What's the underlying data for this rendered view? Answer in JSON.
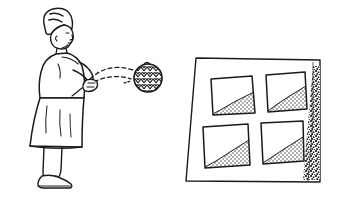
{
  "image": {
    "title": "Woman tossing a textured ball toward a perforated target board",
    "style": "black-and-white line drawing",
    "background_color": "#ffffff",
    "ink_color": "#1a1a1a",
    "width": 339,
    "height": 199
  },
  "figure": {
    "name": "woman-figure",
    "description": "Woman standing in profile facing right, arms extended forward after releasing a ball",
    "parts": [
      {
        "name": "head",
        "label": "head with short wavy hair"
      },
      {
        "name": "hair",
        "label": "short wavy hair"
      },
      {
        "name": "face",
        "label": "face in right profile"
      },
      {
        "name": "torso",
        "label": "torso in long dress"
      },
      {
        "name": "arm",
        "label": "extended arm"
      },
      {
        "name": "hands",
        "label": "open hands released forward"
      },
      {
        "name": "skirt",
        "label": "long skirt to calf"
      },
      {
        "name": "legs",
        "label": "legs"
      },
      {
        "name": "shoe",
        "label": "flat shoe"
      }
    ]
  },
  "ball": {
    "name": "textured-ball",
    "label": "ball with zigzag chevron weave texture",
    "center_x": 148,
    "center_y": 78,
    "radius": 14,
    "texture": "zigzag-chevron"
  },
  "trajectory": {
    "name": "motion-arcs",
    "label": "dashed motion arcs showing the ball's flight path",
    "arc_count": 2,
    "dash_pattern": "4 3"
  },
  "board": {
    "name": "target-board",
    "label": "rectangular board in perspective with four cut-out openings",
    "corners": {
      "top_left": [
        196,
        58
      ],
      "top_right": [
        320,
        60
      ],
      "bottom_right": [
        320,
        182
      ],
      "bottom_left": [
        186,
        181
      ]
    },
    "edge_shadow": {
      "name": "board-edge-shadow",
      "label": "stippled shadow wedge along right edge",
      "texture": "stipple"
    },
    "openings": [
      {
        "name": "opening-top-left",
        "label": "top-left opening with stippled ramp",
        "ramp": "rises to the right",
        "fill_texture": "stipple"
      },
      {
        "name": "opening-top-right",
        "label": "top-right opening with stippled ramp",
        "ramp": "rises to the right",
        "fill_texture": "stipple"
      },
      {
        "name": "opening-bottom-left",
        "label": "bottom-left opening with stippled ramp",
        "ramp": "rises to the right",
        "fill_texture": "stipple"
      },
      {
        "name": "opening-bottom-right",
        "label": "bottom-right opening with stippled ramp",
        "ramp": "rises to the right",
        "fill_texture": "stipple"
      }
    ]
  }
}
